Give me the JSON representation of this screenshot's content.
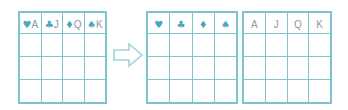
{
  "diagram": {
    "accent_color": "#4aa8bc",
    "border_color": "#7cc4cf",
    "rank_text_color": "#8a9a9e",
    "background_color": "#ffffff"
  },
  "arrow": {
    "name": "right-arrow",
    "direction": "right",
    "stroke_color": "#9fd4dc",
    "fill_color": "#ffffff"
  },
  "tables": {
    "combined": {
      "name": "combined-card-table",
      "columns": 4,
      "body_rows": 3,
      "headers": [
        {
          "suit": "♥",
          "rank": "A"
        },
        {
          "suit": "♣",
          "rank": "J"
        },
        {
          "suit": "♦",
          "rank": "Q"
        },
        {
          "suit": "♠",
          "rank": "K"
        }
      ],
      "rows": [
        [
          "",
          "",
          "",
          ""
        ],
        [
          "",
          "",
          "",
          ""
        ],
        [
          "",
          "",
          "",
          ""
        ]
      ]
    },
    "suits": {
      "name": "suit-table",
      "columns": 4,
      "body_rows": 3,
      "headers": [
        "♥",
        "♣",
        "♦",
        "♠"
      ],
      "rows": [
        [
          "",
          "",
          "",
          ""
        ],
        [
          "",
          "",
          "",
          ""
        ],
        [
          "",
          "",
          "",
          ""
        ]
      ]
    },
    "ranks": {
      "name": "rank-table",
      "columns": 4,
      "body_rows": 3,
      "headers": [
        "A",
        "J",
        "Q",
        "K"
      ],
      "rows": [
        [
          "",
          "",
          "",
          ""
        ],
        [
          "",
          "",
          "",
          ""
        ],
        [
          "",
          "",
          "",
          ""
        ]
      ]
    }
  }
}
